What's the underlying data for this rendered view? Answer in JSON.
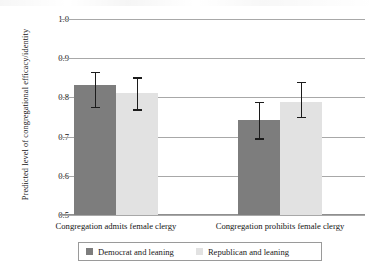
{
  "chart_data": {
    "type": "bar",
    "title": "",
    "xlabel": "",
    "ylabel": "Predicted level of congregational efficacy/identity",
    "ylim": [
      0.5,
      1.0
    ],
    "yticks": [
      "0.5",
      "0.6",
      "0.7",
      "0.8",
      "0.9",
      "1.0"
    ],
    "ytick_values": [
      0.5,
      0.6,
      0.7,
      0.8,
      0.9,
      1.0
    ],
    "grid": true,
    "legend_position": "bottom",
    "categories": [
      "Congregation admits female clergy",
      "Congregation prohibits female clergy"
    ],
    "series": [
      {
        "name": "Democrat and leaning",
        "color": "#7d7d7d",
        "values": [
          0.832,
          0.742
        ],
        "error_low": [
          0.774,
          0.694
        ],
        "error_high": [
          0.864,
          0.787
        ]
      },
      {
        "name": "Republican and leaning",
        "color": "#e2e2e2",
        "values": [
          0.811,
          0.788
        ],
        "error_low": [
          0.768,
          0.748
        ],
        "error_high": [
          0.849,
          0.838
        ]
      }
    ]
  },
  "legend": {
    "items": [
      {
        "label": "Democrat and leaning",
        "swatch": "dem-swatch"
      },
      {
        "label": "Republican and leaning",
        "swatch": "rep-swatch"
      }
    ]
  },
  "axis": {
    "ylabel": "Predicted level of congregational efficacy/identity",
    "ticks": [
      "1.0",
      "0.9",
      "0.8",
      "0.7",
      "0.6",
      "0.5"
    ]
  },
  "categories": [
    "Congregation admits female clergy",
    "Congregation prohibits female clergy"
  ]
}
